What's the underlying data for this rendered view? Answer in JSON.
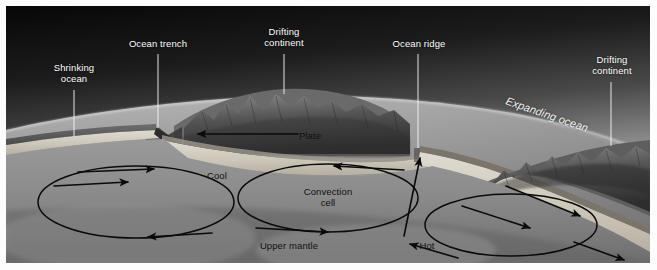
{
  "figure": {
    "frame_border_color": "#ffffff",
    "background_color": "#1a1a1a"
  },
  "palette": {
    "sky_top": "#0d0d0d",
    "sky_mid": "#6e6e6e",
    "sky_horizon": "#d0d0d0",
    "ocean": "#8e8e8e",
    "ocean_dark": "#6a6a6a",
    "crust": "#5a5a5a",
    "lithosphere": "#cfc9bd",
    "asthenosphere": "#8a8a8a",
    "mantle_deep": "#7d7d7d",
    "slab": "#3b3b3b",
    "mountain": "#4a4a4a",
    "arrow": "#0a0a0a",
    "leader": "#f4f4f4",
    "label_light": "#ffffff",
    "label_dark": "#111111"
  },
  "labels": {
    "shrinking_ocean": "Shrinking\nocean",
    "ocean_trench": "Ocean trench",
    "drifting_continent_left": "Drifting\ncontinent",
    "ocean_ridge": "Ocean ridge",
    "drifting_continent_right": "Drifting\ncontinent",
    "expanding_ocean": "Expanding ocean",
    "plate": "Plate",
    "cool": "Cool",
    "convection_cell": "Convection\ncell",
    "upper_mantle": "Upper mantle",
    "hot": "Hot"
  },
  "diagram_elements": {
    "convection_cells": [
      {
        "name": "left-convection-cell",
        "direction": "clockwise",
        "cx": 130,
        "cy": 196,
        "rx": 98,
        "ry": 36
      },
      {
        "name": "center-convection-cell",
        "direction": "counterclockwise",
        "cx": 320,
        "cy": 192,
        "rx": 90,
        "ry": 34
      },
      {
        "name": "right-convection-cell",
        "direction": "clockwise",
        "cx": 505,
        "cy": 218,
        "rx": 88,
        "ry": 32
      }
    ],
    "arrows": [
      {
        "name": "plate-motion-arrow-left",
        "label": "Plate",
        "direction": "left"
      },
      {
        "name": "subduction-surface-arrow",
        "direction": "right"
      },
      {
        "name": "ridge-upwelling-arrow",
        "direction": "up"
      },
      {
        "name": "seafloor-spreading-arrow-right",
        "direction": "right-down"
      }
    ]
  }
}
